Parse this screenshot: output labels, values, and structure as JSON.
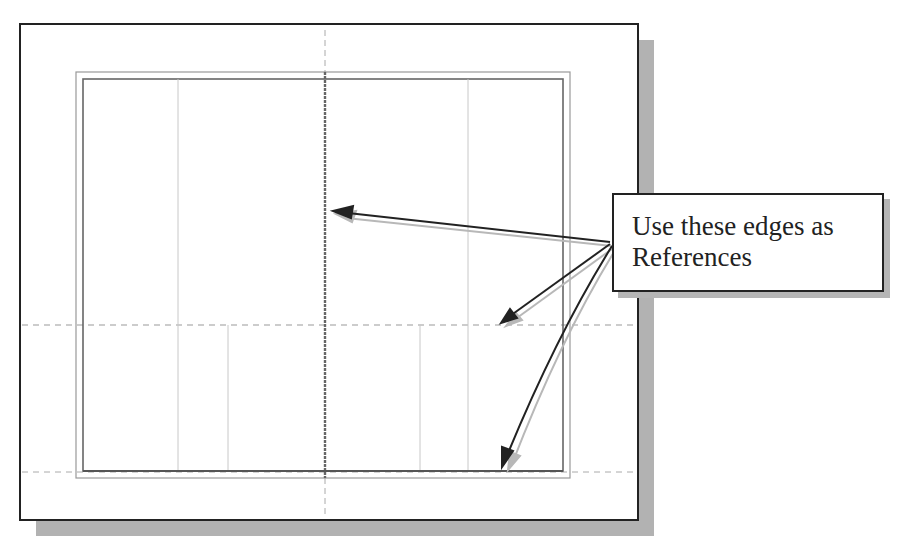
{
  "figure": {
    "type": "sketch-reference-illustration",
    "callout": {
      "line1": "Use these edges as",
      "line2": "References"
    },
    "colors": {
      "frame": "#222222",
      "shadow": "#b0b0b0",
      "border_line": "#777777",
      "center_line": "#666666",
      "construction_line": "#c8c8c8",
      "arrow": "#222222",
      "arrow_shadow": "#b5b5b5"
    },
    "arrows": [
      {
        "name": "to-vertical-centerline",
        "from": [
          610,
          242
        ],
        "to": [
          334,
          211
        ]
      },
      {
        "name": "to-horizontal-centerline",
        "from": [
          610,
          245
        ],
        "to": [
          502,
          322
        ]
      },
      {
        "name": "to-bottom-edge",
        "from": [
          612,
          248
        ],
        "to": [
          502,
          468
        ]
      }
    ]
  }
}
